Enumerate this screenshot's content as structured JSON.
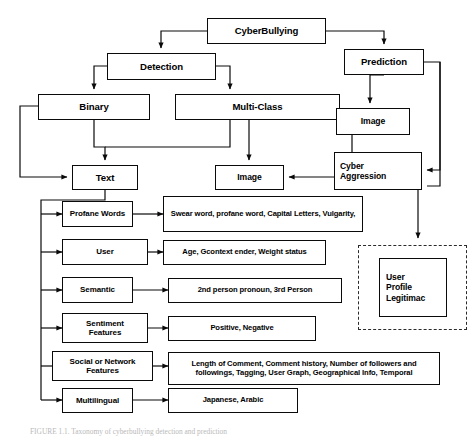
{
  "diagram": {
    "title_node": {
      "label": "CyberBullying"
    },
    "branches": {
      "detection": {
        "label": "Detection"
      },
      "prediction": {
        "label": "Prediction"
      }
    },
    "detection_children": {
      "binary": {
        "label": "Binary"
      },
      "multiclass": {
        "label": "Multi-Class"
      }
    },
    "modalities": {
      "text": {
        "label": "Text"
      },
      "image": {
        "label": "Image"
      }
    },
    "prediction_children": {
      "image": {
        "label": "Image"
      },
      "cyber_aggression": {
        "label": "Cyber\nAggression"
      }
    },
    "dashed_group": {
      "node": {
        "label": "User\nProfile\nLegitimac"
      }
    },
    "features": [
      {
        "name": "Profane Words",
        "detail": "Swear word, profane word, Capital Letters, Vulgarity,"
      },
      {
        "name": "User",
        "detail": "Age, Gcontext ender, Weight status"
      },
      {
        "name": "Semantic",
        "detail": "2nd person pronoun, 3rd Person"
      },
      {
        "name": "Sentiment\nFeatures",
        "detail": "Positive, Negative"
      },
      {
        "name": "Social or Network\nFeatures",
        "detail": "Length of Comment, Comment history, Number of followers and followings, Tagging, User Graph, Geographical Info, Temporal"
      },
      {
        "name": "Multilingual",
        "detail": "Japanese, Arabic"
      }
    ],
    "caption": "FIGURE 1.1. Taxonomy of cyberbullying detection and prediction"
  }
}
